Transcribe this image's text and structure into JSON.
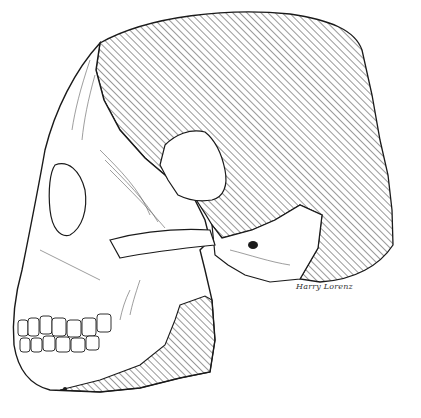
{
  "illustration": {
    "subject": "fossil hominid skull, left lateral view, pen-and-ink",
    "reconstructed_areas_style": "diagonal hatching",
    "signature": "Harry Lorenz",
    "colors": {
      "ink": "#1a1a1a",
      "paper": "#ffffff"
    }
  }
}
